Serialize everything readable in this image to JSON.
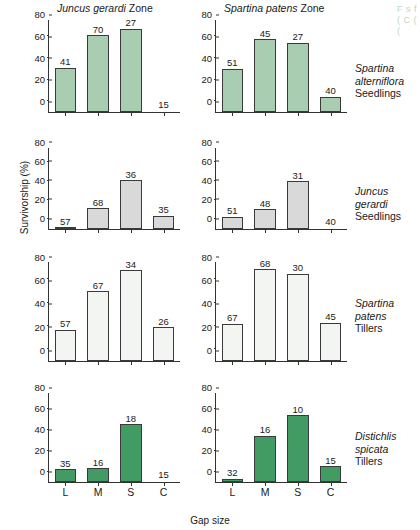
{
  "figure": {
    "xlabel": "Gap size",
    "ylabel": "Survivorship (%)",
    "column_titles": [
      {
        "genus": "Juncus gerardi",
        "suffix": "Zone"
      },
      {
        "genus": "Spartina patens",
        "suffix": "Zone"
      }
    ],
    "row_labels": [
      {
        "genus_line1": "Spartina",
        "genus_line2": "alterniflora",
        "stage": "Seedlings"
      },
      {
        "genus_line1": "Juncus",
        "genus_line2": "gerardi",
        "stage": "Seedlings"
      },
      {
        "genus_line1": "Spartina",
        "genus_line2": "patens",
        "stage": "Tillers"
      },
      {
        "genus_line1": "Distichlis",
        "genus_line2": "spicata",
        "stage": "Tillers"
      }
    ],
    "yticks": [
      "0",
      "20",
      "40",
      "60",
      "80"
    ],
    "bleed_text": "F\ns\nf\n(\nC\n(\n("
  },
  "chart_data": {
    "type": "bar",
    "xlabel": "Gap size",
    "ylabel": "Survivorship (%)",
    "ylim": [
      0,
      85
    ],
    "yticks": [
      0,
      20,
      40,
      60,
      80
    ],
    "grid": false,
    "legend": "none",
    "categories": [
      "L",
      "M",
      "S",
      "C"
    ],
    "category_meaning": {
      "L": "Large gap",
      "M": "Medium gap",
      "S": "Small gap",
      "C": "Control"
    },
    "bar_label_meaning": "sample size (n) printed above each bar",
    "panels": [
      {
        "row": 1,
        "column": 1,
        "zone": "Juncus gerardi Zone",
        "species": "Spartina alterniflora",
        "stage": "Seedlings",
        "fill_color": "#a9cdb1",
        "values": [
          41,
          71,
          77,
          0
        ],
        "sample_sizes": [
          41,
          70,
          27,
          15
        ]
      },
      {
        "row": 1,
        "column": 2,
        "zone": "Spartina patens Zone",
        "species": "Spartina alterniflora",
        "stage": "Seedlings",
        "fill_color": "#a9cdb1",
        "values": [
          40,
          67,
          64,
          14
        ],
        "sample_sizes": [
          51,
          45,
          27,
          40
        ]
      },
      {
        "row": 2,
        "column": 1,
        "zone": "Juncus gerardi Zone",
        "species": "Juncus gerardi",
        "stage": "Seedlings",
        "fill_color": "#d9d9d9",
        "values": [
          2,
          22,
          51,
          14
        ],
        "sample_sizes": [
          57,
          68,
          36,
          35
        ]
      },
      {
        "row": 2,
        "column": 2,
        "zone": "Spartina patens Zone",
        "species": "Juncus gerardi",
        "stage": "Seedlings",
        "fill_color": "#d9d9d9",
        "values": [
          13,
          21,
          50,
          0
        ],
        "sample_sizes": [
          51,
          48,
          31,
          40
        ]
      },
      {
        "row": 3,
        "column": 1,
        "zone": "Juncus gerardi Zone",
        "species": "Spartina patens",
        "stage": "Tillers",
        "fill_color": "#f2f5f2",
        "values": [
          27,
          60,
          78,
          29
        ],
        "sample_sizes": [
          57,
          67,
          34,
          26
        ]
      },
      {
        "row": 3,
        "column": 2,
        "zone": "Spartina patens Zone",
        "species": "Spartina patens",
        "stage": "Tillers",
        "fill_color": "#f2f5f2",
        "values": [
          32,
          79,
          75,
          33
        ],
        "sample_sizes": [
          67,
          68,
          30,
          45
        ]
      },
      {
        "row": 4,
        "column": 1,
        "zone": "Juncus gerardi Zone",
        "species": "Distichlis spicata",
        "stage": "Tillers",
        "fill_color": "#419b63",
        "values": [
          12,
          13,
          55,
          0
        ],
        "sample_sizes": [
          35,
          16,
          18,
          15
        ]
      },
      {
        "row": 4,
        "column": 2,
        "zone": "Spartina patens Zone",
        "species": "Distichlis spicata",
        "stage": "Tillers",
        "fill_color": "#419b63",
        "values": [
          3,
          44,
          64,
          15
        ],
        "sample_sizes": [
          32,
          16,
          10,
          15
        ]
      }
    ]
  }
}
